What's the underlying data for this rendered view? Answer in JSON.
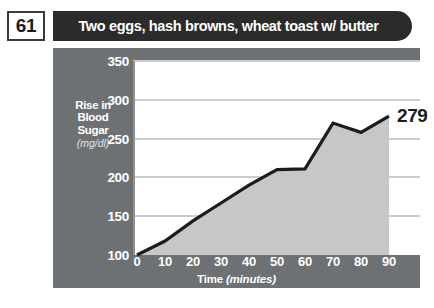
{
  "header": {
    "number": "61",
    "title": "Two eggs, hash browns, wheat toast w/ butter"
  },
  "colors": {
    "panel_gray": "#6e7174",
    "header_bar": "#2b2b2b",
    "curve_line": "#1c1c1c",
    "area_fill": "#c6c7c8",
    "gridline": "#c9cbcd",
    "plot_background": "#ffffff"
  },
  "axis": {
    "y_label_main": "Rise in Blood Sugar",
    "y_label_line1": "Rise in",
    "y_label_line2": "Blood",
    "y_label_line3": "Sugar",
    "y_label_unit": "(mg/dl)",
    "y_ticks": [
      "350",
      "300",
      "250",
      "200",
      "150",
      "100"
    ],
    "x_title_main": "Time",
    "x_title_unit": "(minutes)",
    "x_ticks": [
      "0",
      "10",
      "20",
      "30",
      "40",
      "50",
      "60",
      "70",
      "80",
      "90"
    ]
  },
  "callout": {
    "end_value": "279"
  },
  "chart_data": {
    "type": "area",
    "title": "Two eggs, hash browns, wheat toast w/ butter",
    "xlabel": "Time (minutes)",
    "ylabel": "Rise in Blood Sugar (mg/dl)",
    "xlim": [
      0,
      90
    ],
    "ylim": [
      100,
      350
    ],
    "grid": true,
    "legend": null,
    "x": [
      0,
      10,
      20,
      30,
      40,
      50,
      60,
      70,
      80,
      90
    ],
    "values": [
      100,
      118,
      144,
      167,
      190,
      210,
      211,
      270,
      258,
      279
    ],
    "annotations": [
      {
        "x": 90,
        "y": 279,
        "text": "279"
      }
    ]
  }
}
